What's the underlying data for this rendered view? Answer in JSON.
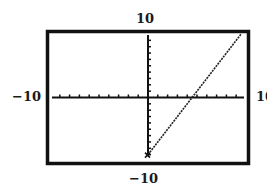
{
  "window": {
    "xmin_label": "−10",
    "xmax_label": "10",
    "ymin_label": "−10",
    "ymax_label": "10"
  },
  "colors": {
    "background": "#ffffff",
    "frame": "#111111",
    "axes": "#111111",
    "graph": "#222222"
  },
  "chart_data": {
    "type": "line",
    "title": "",
    "xlabel": "",
    "ylabel": "",
    "xlim": [
      -10,
      10
    ],
    "ylim": [
      -10,
      10
    ],
    "xscl": 1,
    "yscl": 1,
    "grid": false,
    "axes_visible": true,
    "tick_labels": {
      "x": [
        "-10",
        "10"
      ],
      "y": [
        "-10",
        "10"
      ]
    },
    "series": [
      {
        "name": "graph",
        "style": "dotted-pixel",
        "x": [
          0,
          4.5,
          9.5
        ],
        "y": [
          -9,
          0,
          10
        ]
      }
    ],
    "annotations": []
  }
}
